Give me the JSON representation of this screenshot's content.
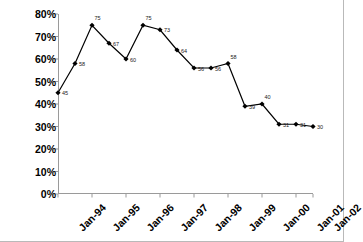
{
  "chart_data": {
    "type": "line",
    "title": "",
    "subtitle": "",
    "xlabel": "",
    "ylabel": "",
    "ylim": [
      0,
      80
    ],
    "y_tick_labels": [
      "80%",
      "70%",
      "60%",
      "50%",
      "40%",
      "30%",
      "20%",
      "10%",
      "0%"
    ],
    "y_tick_values": [
      80,
      70,
      60,
      50,
      40,
      30,
      20,
      10,
      0
    ],
    "x_tick_labels": [
      "Jan-94",
      "Jan-95",
      "Jan-96",
      "Jan-97",
      "Jan-98",
      "Jan-99",
      "Jan-00",
      "Jan-01",
      "Jan-02"
    ],
    "categories": [
      "Jan-94",
      "Jul-94",
      "Jan-95",
      "Jul-95",
      "Jan-96",
      "Jul-96",
      "Jan-97",
      "Jul-97",
      "Jan-98",
      "Jul-98",
      "Jan-99",
      "Jul-99",
      "Jan-00",
      "Jul-00",
      "Jan-01",
      "Jul-01"
    ],
    "values": [
      45,
      58,
      75,
      67,
      60,
      75,
      73,
      64,
      56,
      56,
      58,
      39,
      40,
      31,
      31,
      30
    ],
    "point_labels": [
      "45",
      "58",
      "75",
      "67",
      "60",
      "75",
      "73",
      "64",
      "56",
      "56",
      "58",
      "39",
      "40",
      "31",
      "31",
      "30"
    ],
    "grid": false,
    "legend": "none",
    "series": [
      {
        "name": "series-1",
        "values": [
          45,
          58,
          75,
          67,
          60,
          75,
          73,
          64,
          56,
          56,
          58,
          39,
          40,
          31,
          31,
          30
        ],
        "line_color": "#000000",
        "marker": "diamond",
        "marker_color": "#000000"
      }
    ],
    "axis_color": "#9a9a9a",
    "frame_border_color": "#b9b9b9"
  }
}
